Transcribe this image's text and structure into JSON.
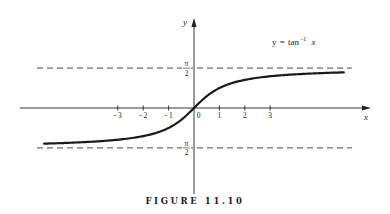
{
  "caption": "FIGURE 11.10",
  "chart_data": {
    "type": "line",
    "title": "",
    "function_label": {
      "y": "y",
      "eq": "=",
      "fn": "tan",
      "sup": "-1",
      "x": "x"
    },
    "xlabel": "x",
    "ylabel": "y",
    "xlim": [
      -6.0,
      6.8
    ],
    "ylim": [
      -3.4,
      3.5
    ],
    "x_ticks": [
      {
        "value": -3,
        "label": "- 3"
      },
      {
        "value": -2,
        "label": "- 2"
      },
      {
        "value": -1,
        "label": "- 1"
      },
      {
        "value": 0,
        "label": "0"
      },
      {
        "value": 1,
        "label": "1"
      },
      {
        "value": 2,
        "label": "2"
      },
      {
        "value": 3,
        "label": "3"
      }
    ],
    "asymptotes": [
      {
        "value": 1.5708,
        "numerator": "π",
        "denominator": "2",
        "style": "dashed"
      },
      {
        "value": -1.5708,
        "numerator": "π",
        "denominator": "2",
        "style": "dashed"
      }
    ],
    "series": [
      {
        "name": "y = tan^-1 x",
        "function": "arctan",
        "x_range": [
          -5.9,
          5.9
        ],
        "sample_points": [
          [
            -5.9,
            -1.403
          ],
          [
            -4,
            -1.326
          ],
          [
            -3,
            -1.249
          ],
          [
            -2,
            -1.107
          ],
          [
            -1,
            -0.785
          ],
          [
            0,
            0
          ],
          [
            1,
            0.785
          ],
          [
            2,
            1.107
          ],
          [
            3,
            1.249
          ],
          [
            4,
            1.326
          ],
          [
            5.9,
            1.403
          ]
        ]
      }
    ],
    "grid": false,
    "legend": "none"
  }
}
